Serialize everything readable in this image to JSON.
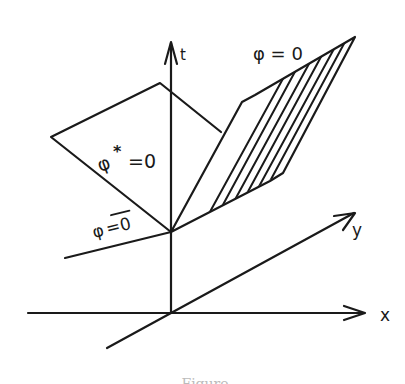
{
  "figure": {
    "axes": {
      "t_label": "t",
      "x_label": "x",
      "y_label": "y"
    },
    "regions": {
      "shaded_label": "φ = 0",
      "star_label_base": "φ",
      "star_label_sup": "*",
      "star_label_eq": "=0",
      "lower_label_phi": "φ",
      "lower_label_eq": "=0"
    },
    "caption": "Figure"
  },
  "colors": {
    "ink": "#1a1a1a",
    "background": "#ffffff"
  }
}
